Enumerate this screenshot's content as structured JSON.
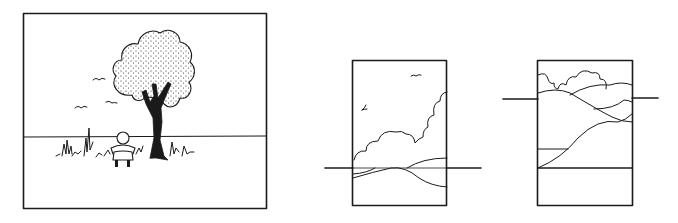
{
  "figure": {
    "panels": [
      {
        "id": "landscape-centered-horizon",
        "subjects": [
          "tree",
          "child",
          "grass",
          "birds"
        ],
        "horizon": "middle"
      },
      {
        "id": "portrait-low-horizon",
        "subjects": [
          "clouds",
          "hills",
          "birds"
        ],
        "horizon": "low"
      },
      {
        "id": "portrait-high-horizon",
        "subjects": [
          "clouds",
          "hills",
          "fields"
        ],
        "horizon": "high"
      }
    ],
    "colors": {
      "ink": "#1a1a1a",
      "paper": "#ffffff"
    }
  }
}
